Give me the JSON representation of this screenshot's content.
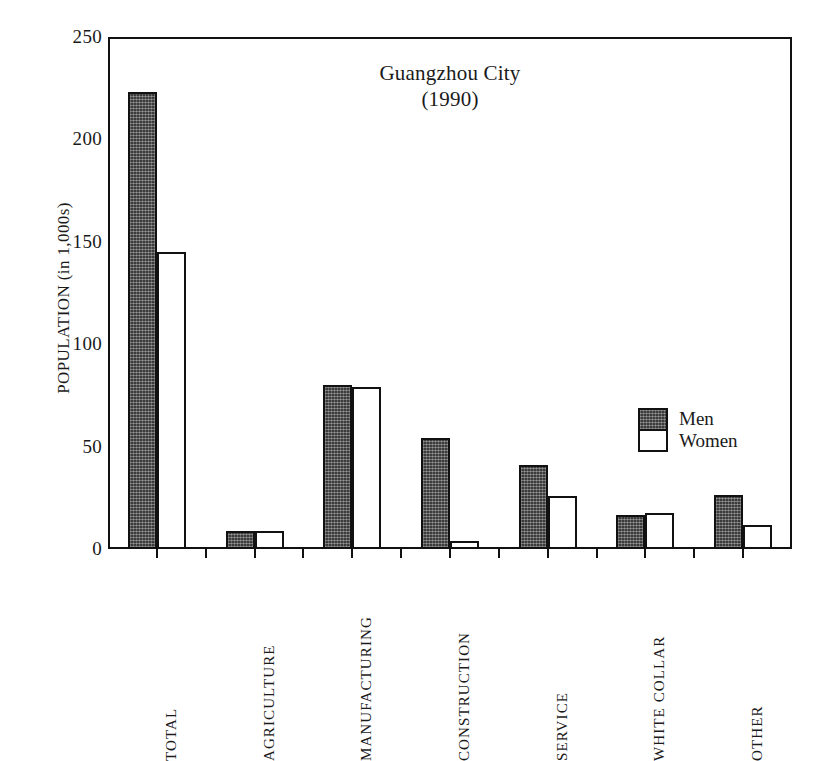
{
  "chart_data": {
    "type": "bar",
    "title": "Guangzhou City",
    "subtitle": "(1990)",
    "xlabel": "",
    "ylabel": "POPULATION (in 1,000s)",
    "ylim": [
      0,
      250
    ],
    "yticks": [
      0,
      50,
      100,
      150,
      200,
      250
    ],
    "ytick_labels": [
      "0",
      "50",
      "100",
      "150",
      "200",
      "250"
    ],
    "grid": false,
    "legend_position": "inside-right",
    "categories": [
      "TOTAL",
      "AGRICULTURE",
      "MANUFACTURING",
      "CONSTRUCTION",
      "SERVICE",
      "WHITE COLLAR",
      "OTHER"
    ],
    "series": [
      {
        "name": "Men",
        "fill": "dark-stipple",
        "color": "#3b3b3b",
        "values": [
          223,
          9,
          80,
          54,
          41,
          16.5,
          26.5
        ]
      },
      {
        "name": "Women",
        "fill": "white",
        "color": "#ffffff",
        "values": [
          145,
          9,
          79,
          4,
          26,
          17.5,
          11.5
        ]
      }
    ]
  },
  "legend": {
    "entries": [
      {
        "label": "Men"
      },
      {
        "label": "Women"
      }
    ]
  },
  "style": {
    "axis_color": "#111111",
    "men_color": "#3b3b3b",
    "women_color": "#ffffff",
    "background": "#ffffff"
  }
}
